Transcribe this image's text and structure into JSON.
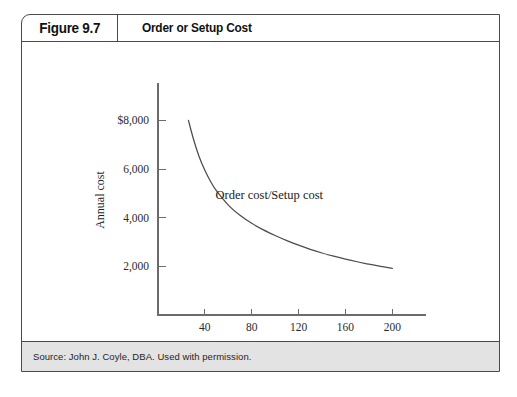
{
  "figure": {
    "number": "Figure 9.7",
    "title": "Order or Setup Cost",
    "source": "Source: John J. Coyle, DBA. Used with permission."
  },
  "chart_data": {
    "type": "line",
    "title": "Order or Setup Cost",
    "xlabel": "Size of order (units)",
    "ylabel": "Annual cost",
    "xlim": [
      0,
      210
    ],
    "ylim": [
      0,
      8800
    ],
    "grid": false,
    "legend": null,
    "xticks": [
      40,
      80,
      120,
      160,
      200
    ],
    "xtick_labels": [
      "40",
      "80",
      "120",
      "160",
      "200"
    ],
    "yticks": [
      2000,
      4000,
      6000,
      8000
    ],
    "ytick_labels": [
      "2,000",
      "4,000",
      "6,000",
      "$8,000"
    ],
    "annotations": [
      {
        "text": "Order cost/Setup cost",
        "x": 95,
        "y": 4750
      }
    ],
    "series": [
      {
        "name": "Order cost/Setup cost",
        "color": "#4d4d4d",
        "x": [
          26,
          30,
          35,
          40,
          45,
          50,
          60,
          70,
          80,
          90,
          100,
          110,
          120,
          130,
          140,
          150,
          160,
          170,
          180,
          190,
          200
        ],
        "y": [
          8000,
          7280,
          6530,
          5950,
          5480,
          5100,
          4520,
          4100,
          3770,
          3500,
          3270,
          3060,
          2870,
          2700,
          2550,
          2420,
          2300,
          2190,
          2090,
          2000,
          1920
        ]
      }
    ]
  }
}
